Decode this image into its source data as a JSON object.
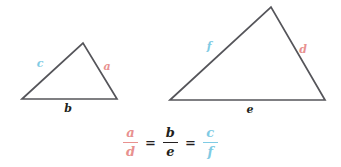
{
  "figure": {
    "colors": {
      "stroke": "#55555a",
      "red": "#e8918f",
      "blue": "#7fcbe4",
      "dark": "#231f20",
      "background": "#ffffff"
    },
    "small_triangle": {
      "name": "small-triangle",
      "points": "22,99 83,43 117,99",
      "labels": {
        "left_side": "c",
        "right_side": "a",
        "base": "b"
      },
      "label_positions": {
        "left_side": {
          "x": 40,
          "y": 64
        },
        "right_side": {
          "x": 107,
          "y": 67
        },
        "base": {
          "x": 68,
          "y": 109
        }
      }
    },
    "large_triangle": {
      "name": "large-triangle",
      "points": "170,100 271,7 325,100",
      "labels": {
        "left_side": "f",
        "right_side": "d",
        "base": "e"
      },
      "label_positions": {
        "left_side": {
          "x": 209,
          "y": 47
        },
        "right_side": {
          "x": 303,
          "y": 50
        },
        "base": {
          "x": 250,
          "y": 110
        }
      }
    }
  },
  "equation": {
    "name": "proportion-equation",
    "text": "a/d = b/e = c/f",
    "terms": [
      {
        "numerator": "a",
        "denominator": "d",
        "color": "red"
      },
      {
        "numerator": "b",
        "denominator": "e",
        "color": "dark"
      },
      {
        "numerator": "c",
        "denominator": "f",
        "color": "blue"
      }
    ],
    "operator_1": "=",
    "operator_2": "="
  }
}
